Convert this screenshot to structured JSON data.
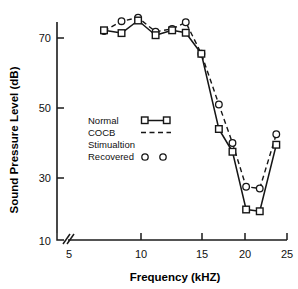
{
  "chart_data": {
    "type": "line",
    "title": "",
    "xlabel": "Frequency (kHZ)",
    "ylabel": "Sound Pressure Level (dB)",
    "xlim": [
      5,
      25.6
    ],
    "ylim": [
      10,
      80
    ],
    "xticks": [
      5,
      10,
      15,
      20,
      25
    ],
    "xticklabels": [
      "5",
      "10",
      "15",
      "20",
      "25"
    ],
    "yticks": [
      10,
      30,
      50,
      70
    ],
    "yticklabels": [
      "10",
      "30",
      "50",
      "70"
    ],
    "grid": false,
    "axis_break": "x-axis broken between 5 and 6 kHz",
    "legend_position": "center-left inside axes",
    "series": [
      {
        "name": "Normal",
        "style": "solid-line-with-open-squares",
        "marker": "square",
        "x": [
          6.2,
          8.0,
          9.7,
          11.5,
          13.2,
          14.6,
          16.2,
          18.0,
          19.4,
          20.8,
          22.2,
          23.9
        ],
        "y": [
          72.2,
          71.4,
          75.0,
          70.8,
          72.2,
          71.5,
          65.5,
          44.0,
          37.5,
          21.0,
          20.5,
          39.5
        ]
      },
      {
        "name": "COCB Stimualtion Recovered",
        "style": "dashed-line-with-open-circles",
        "marker": "circle",
        "x": [
          6.2,
          8.0,
          9.7,
          11.5,
          13.2,
          14.6,
          16.2,
          18.0,
          19.4,
          20.8,
          22.2,
          23.9
        ],
        "y": [
          72.0,
          74.8,
          75.8,
          71.8,
          72.6,
          74.5,
          65.5,
          51.0,
          40.0,
          27.5,
          27.0,
          42.5
        ]
      }
    ],
    "recovered_points": {
      "name": "Recovered",
      "marker": "circle",
      "x": [
        6.2,
        8.0,
        9.7,
        11.5,
        13.2,
        14.6,
        16.2,
        18.0,
        19.4,
        20.8,
        22.2,
        23.9
      ],
      "y": [
        72.0,
        74.8,
        75.8,
        71.8,
        72.6,
        74.5,
        65.5,
        51.0,
        40.0,
        27.5,
        27.0,
        42.5
      ]
    }
  },
  "legend": {
    "entries": [
      {
        "label": "Normal",
        "sample": "line-with-squares"
      },
      {
        "label": "COCB",
        "sample": "dashed-line"
      },
      {
        "label": "Stimualtion",
        "sample": "none"
      },
      {
        "label": "Recovered",
        "sample": "two-circles"
      }
    ]
  },
  "colors": {
    "ink": "#161616",
    "background": "#ffffff"
  }
}
